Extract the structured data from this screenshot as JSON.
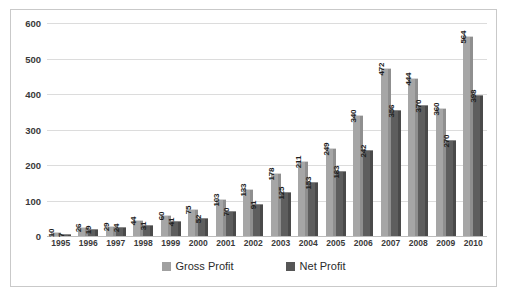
{
  "chart_data": {
    "type": "bar",
    "title": "",
    "subtitle": "",
    "xlabel": "",
    "ylabel": "",
    "ylim": [
      0,
      600
    ],
    "ytick_step": 100,
    "yticks": [
      600,
      500,
      400,
      300,
      200,
      100,
      0
    ],
    "grid": true,
    "legend_position": "bottom-center",
    "categories": [
      "1995",
      "1996",
      "1997",
      "1998",
      "1999",
      "2000",
      "2001",
      "2002",
      "2003",
      "2004",
      "2005",
      "2006",
      "2007",
      "2008",
      "2009",
      "2010"
    ],
    "series": [
      {
        "name": "Gross Profit",
        "color": "#a0a0a0",
        "values": [
          10,
          26,
          29,
          44,
          60,
          75,
          103,
          133,
          178,
          211,
          249,
          340,
          472,
          444,
          360,
          564
        ]
      },
      {
        "name": "Net Profit",
        "color": "#565656",
        "values": [
          7,
          19,
          24,
          31,
          41,
          52,
          70,
          91,
          125,
          153,
          183,
          242,
          356,
          370,
          270,
          398
        ]
      }
    ]
  },
  "legend": {
    "items": [
      {
        "label": "Gross Profit",
        "swatch": "gross"
      },
      {
        "label": "Net Profit",
        "swatch": "net"
      }
    ]
  },
  "colors": {
    "gross_profit": "#a0a0a0",
    "net_profit": "#565656",
    "gridline": "#dcdcdc",
    "border": "#c9c9c9",
    "background": "#ffffff",
    "axis_text": "#3a3a3a"
  }
}
